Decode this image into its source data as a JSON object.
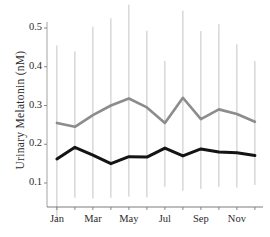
{
  "chart_data": {
    "type": "line",
    "title": "",
    "xlabel": "",
    "ylabel": "Urinary Melatonin  (nM)",
    "ylim": [
      0.0,
      0.55
    ],
    "yticks": [
      0.1,
      0.2,
      0.3,
      0.4,
      0.5
    ],
    "ytick_labels": [
      "0.1",
      "0.2",
      "0.3",
      "0.4",
      "0.5"
    ],
    "categories": [
      "Jan",
      "Feb",
      "Mar",
      "Apr",
      "May",
      "Jun",
      "Jul",
      "Aug",
      "Sep",
      "Oct",
      "Nov",
      "Dec"
    ],
    "xtick_labels": [
      "Jan",
      "",
      "Mar",
      "",
      "May",
      "",
      "Jul",
      "",
      "Sep",
      "",
      "Nov",
      ""
    ],
    "xtick_labels_shown": [
      "Jan",
      "Mar",
      "May",
      "Jul",
      "Sep",
      "Nov"
    ],
    "grid": false,
    "legend": "none",
    "series": [
      {
        "name": "upper-gray-series",
        "color": "#8c8c8c",
        "values": [
          0.255,
          0.245,
          0.275,
          0.3,
          0.318,
          0.295,
          0.255,
          0.32,
          0.265,
          0.29,
          0.278,
          0.258
        ],
        "error_top": [
          0.455,
          0.44,
          0.503,
          0.525,
          0.56,
          0.493,
          0.415,
          0.545,
          0.492,
          0.51,
          0.458,
          0.415
        ],
        "error_bottom": [
          0.005,
          0.062,
          0.06,
          0.062,
          0.065,
          0.063,
          0.09,
          0.08,
          0.085,
          0.09,
          0.088,
          0.095
        ]
      },
      {
        "name": "lower-black-series",
        "color": "#141414",
        "values": [
          0.162,
          0.192,
          0.172,
          0.15,
          0.168,
          0.167,
          0.19,
          0.17,
          0.188,
          0.18,
          0.178,
          0.171
        ]
      }
    ]
  },
  "axes": {
    "y_axis_title": "Urinary Melatonin  (nM)"
  }
}
